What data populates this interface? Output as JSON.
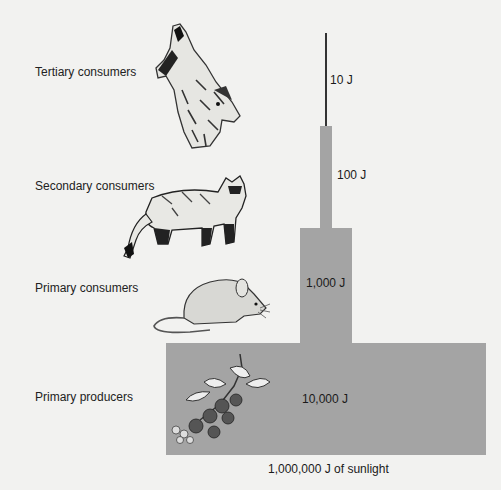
{
  "levels": [
    {
      "name": "Tertiary consumers",
      "energy": "10 J",
      "organism": "wolf"
    },
    {
      "name": "Secondary consumers",
      "energy": "100 J",
      "organism": "ferret"
    },
    {
      "name": "Primary consumers",
      "energy": "1,000 J",
      "organism": "mouse"
    },
    {
      "name": "Primary producers",
      "energy": "10,000 J",
      "organism": "blackberry plant"
    }
  ],
  "source": "1,000,000 J of sunlight",
  "colors": {
    "bar": "#a4a4a4",
    "background": "#f2f2f0"
  }
}
